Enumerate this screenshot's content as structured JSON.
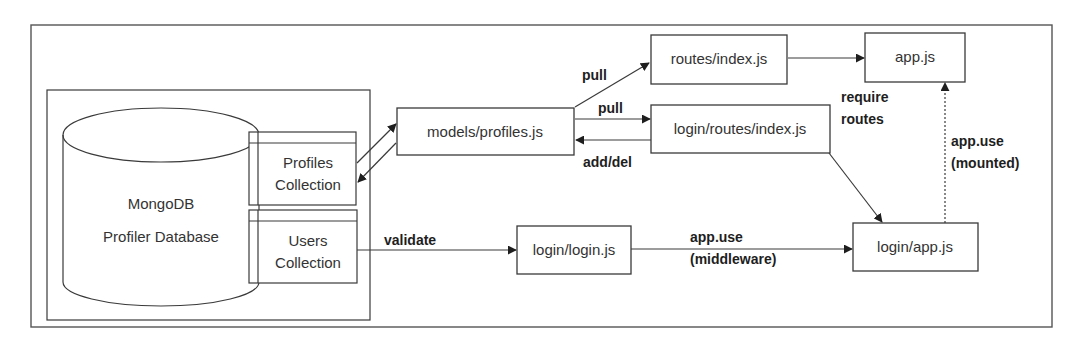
{
  "diagram": {
    "type": "architecture-flow",
    "database": {
      "title": "MongoDB",
      "subtitle": "Profiler Database",
      "collections": [
        {
          "line1": "Profiles",
          "line2": "Collection"
        },
        {
          "line1": "Users",
          "line2": "Collection"
        }
      ]
    },
    "nodes": {
      "models_profiles": "models/profiles.js",
      "routes_index": "routes/index.js",
      "app": "app.js",
      "login_routes_index": "login/routes/index.js",
      "login_login": "login/login.js",
      "login_app": "login/app.js"
    },
    "edges": [
      {
        "from": "Profiles Collection",
        "to": "models/profiles.js",
        "label": ""
      },
      {
        "from": "models/profiles.js",
        "to": "Profiles Collection",
        "label": ""
      },
      {
        "from": "models/profiles.js",
        "to": "routes/index.js",
        "label": "pull"
      },
      {
        "from": "models/profiles.js",
        "to": "login/routes/index.js",
        "label": "pull"
      },
      {
        "from": "login/routes/index.js",
        "to": "models/profiles.js",
        "label": "add/del"
      },
      {
        "from": "routes/index.js",
        "to": "app.js",
        "label": "require routes"
      },
      {
        "from": "login/routes/index.js",
        "to": "login/app.js",
        "label": ""
      },
      {
        "from": "Users Collection",
        "to": "login/login.js",
        "label": "validate"
      },
      {
        "from": "login/login.js",
        "to": "login/app.js",
        "label": "app.use (middleware)"
      },
      {
        "from": "login/app.js",
        "to": "app.js",
        "label": "app.use (mounted)",
        "style": "dotted"
      }
    ],
    "labels": {
      "pull_top": "pull",
      "pull_mid": "pull",
      "add_del": "add/del",
      "require_line1": "require",
      "require_line2": "routes",
      "validate": "validate",
      "appuse_mw_line1": "app.use",
      "appuse_mw_line2": "(middleware)",
      "appuse_mount_line1": "app.use",
      "appuse_mount_line2": "(mounted)"
    }
  }
}
